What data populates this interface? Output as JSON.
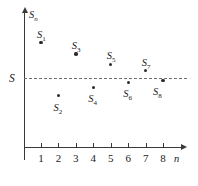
{
  "figure": {
    "background_color": "#ffffff",
    "axis_color": "#3a3a3a",
    "point_color": "#2b2b2b",
    "dashed_line_color": "#6e6e6e"
  },
  "axes": {
    "y_label": "S",
    "y_label_sub": "n",
    "x_label": "n",
    "limit_label": "S",
    "x_tick_labels": [
      "1",
      "2",
      "3",
      "4",
      "5",
      "6",
      "7",
      "8"
    ]
  },
  "points": [
    {
      "label": "S",
      "sub": "1",
      "n": 1,
      "label_pos": "above"
    },
    {
      "label": "S",
      "sub": "2",
      "n": 2,
      "label_pos": "below"
    },
    {
      "label": "S",
      "sub": "3",
      "n": 3,
      "label_pos": "above"
    },
    {
      "label": "S",
      "sub": "4",
      "n": 4,
      "label_pos": "below"
    },
    {
      "label": "S",
      "sub": "5",
      "n": 5,
      "label_pos": "above"
    },
    {
      "label": "S",
      "sub": "6",
      "n": 6,
      "label_pos": "below"
    },
    {
      "label": "S",
      "sub": "7",
      "n": 7,
      "label_pos": "above"
    },
    {
      "label": "S",
      "sub": "8",
      "n": 8,
      "label_pos": "right-below"
    }
  ],
  "chart_data": {
    "type": "scatter",
    "title": "",
    "xlabel": "n",
    "ylabel": "S_n",
    "x": [
      1,
      2,
      3,
      4,
      5,
      6,
      7,
      8
    ],
    "series": [
      {
        "name": "S_n",
        "point_labels": [
          "S_1",
          "S_2",
          "S_3",
          "S_4",
          "S_5",
          "S_6",
          "S_7",
          "S_8"
        ],
        "values": [
          2.08,
          -1.03,
          1.42,
          -0.55,
          0.8,
          -0.26,
          0.44,
          -0.13
        ]
      }
    ],
    "annotations": [
      {
        "type": "hline",
        "label": "S",
        "value": 0,
        "style": "dashed",
        "description": "Horizontal dashed line marking the limit S of the sequence"
      }
    ],
    "xlim": [
      0,
      8.9
    ],
    "ylim": [
      -2.6,
      3.2
    ],
    "grid": false,
    "legend": false
  }
}
